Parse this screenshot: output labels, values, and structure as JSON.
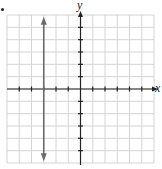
{
  "chart_data": {
    "type": "line",
    "title": "",
    "xlabel": "x",
    "ylabel": "y",
    "xlim": [
      -6,
      6
    ],
    "ylim": [
      -6,
      6
    ],
    "grid": true,
    "grid_cells": 12,
    "x_ticks": [
      -5,
      -4,
      -3,
      -2,
      -1,
      1,
      2,
      3,
      4,
      5
    ],
    "y_ticks": [
      -5,
      -4,
      -3,
      -2,
      -1,
      1,
      2,
      3,
      4,
      5
    ],
    "tick_labels_shown": false,
    "series": [
      {
        "name": "vertical line x = -3",
        "equation": "x = -3",
        "points": [
          [
            -3,
            5.7
          ],
          [
            -3,
            -5.7
          ]
        ],
        "arrows": "both",
        "color": "#6b6b6b"
      }
    ]
  },
  "labels": {
    "x_axis": "x",
    "y_axis": "y"
  },
  "colors": {
    "grid": "#d4d4d4",
    "axis": "#222222",
    "line": "#6b6b6b"
  }
}
